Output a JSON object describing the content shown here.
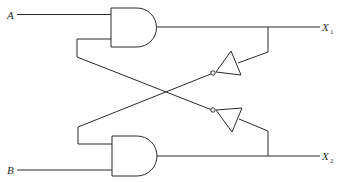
{
  "diagram": {
    "type": "logic-circuit",
    "colors": {
      "stroke": "#2a2a2a",
      "background": "#ffffff"
    },
    "inputs": [
      {
        "label": "A",
        "gate": "and-gate-1"
      },
      {
        "label": "B",
        "gate": "and-gate-2"
      }
    ],
    "outputs": [
      {
        "label": "X",
        "subscript": "1",
        "from": "and-gate-1"
      },
      {
        "label": "X",
        "subscript": "2",
        "from": "and-gate-2"
      }
    ],
    "components": [
      {
        "id": "and-gate-1",
        "kind": "AND"
      },
      {
        "id": "and-gate-2",
        "kind": "AND"
      },
      {
        "id": "inverter-1",
        "kind": "NOT",
        "input_from": "X1",
        "output_to": "and-gate-2"
      },
      {
        "id": "inverter-2",
        "kind": "NOT",
        "input_from": "X2",
        "output_to": "and-gate-1"
      }
    ]
  }
}
